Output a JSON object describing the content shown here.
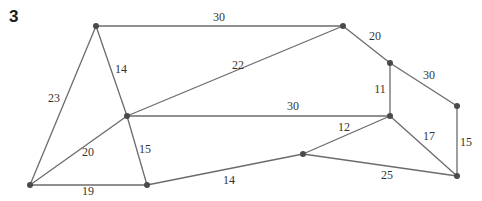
{
  "question_number": "3",
  "graph": {
    "nodes": [
      "A",
      "B",
      "C",
      "D",
      "E",
      "F",
      "G",
      "H",
      "I",
      "J"
    ],
    "edges": [
      {
        "from": "A",
        "to": "B",
        "weight": "30"
      },
      {
        "from": "B",
        "to": "C",
        "weight": "20"
      },
      {
        "from": "C",
        "to": "D",
        "weight": "30"
      },
      {
        "from": "A",
        "to": "E",
        "weight": "14"
      },
      {
        "from": "A",
        "to": "H",
        "weight": "23"
      },
      {
        "from": "E",
        "to": "B",
        "weight": "22"
      },
      {
        "from": "E",
        "to": "F",
        "weight": "30"
      },
      {
        "from": "C",
        "to": "F",
        "weight": "11"
      },
      {
        "from": "E",
        "to": "H",
        "weight": "20"
      },
      {
        "from": "E",
        "to": "I",
        "weight": "15"
      },
      {
        "from": "H",
        "to": "I",
        "weight": "19"
      },
      {
        "from": "I",
        "to": "G",
        "weight": "14"
      },
      {
        "from": "G",
        "to": "F",
        "weight": "12"
      },
      {
        "from": "F",
        "to": "J",
        "weight": "17"
      },
      {
        "from": "D",
        "to": "J",
        "weight": "15"
      },
      {
        "from": "G",
        "to": "J",
        "weight": "25"
      }
    ]
  }
}
